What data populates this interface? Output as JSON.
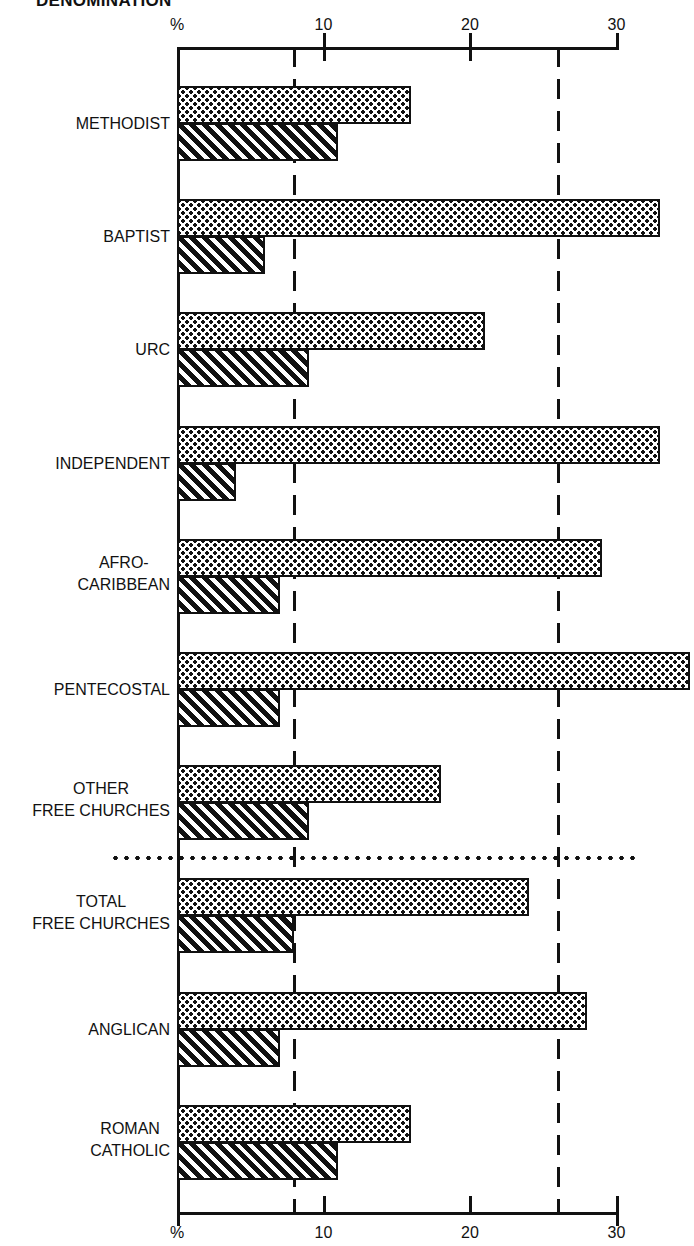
{
  "title": "DENOMINATION",
  "axis": {
    "unit_label": "%",
    "ticks": [
      {
        "value": 10,
        "label": "10"
      },
      {
        "value": 20,
        "label": "20"
      },
      {
        "value": 30,
        "label": "30"
      }
    ]
  },
  "reference_lines": [
    8,
    26
  ],
  "colors": {
    "ink": "#111111",
    "background": "#ffffff"
  },
  "chart_data": {
    "type": "bar",
    "orientation": "horizontal",
    "title": "DENOMINATION",
    "xlabel": "%",
    "ylabel": "",
    "xlim": [
      0,
      30
    ],
    "grid": false,
    "x_ticks": [
      0,
      10,
      20,
      30
    ],
    "axes": "top and bottom percentage scales",
    "categories": [
      "METHODIST",
      "BAPTIST",
      "URC",
      "INDEPENDENT",
      "AFRO-CARIBBEAN",
      "PENTECOSTAL",
      "OTHER FREE CHURCHES",
      "TOTAL FREE CHURCHES",
      "ANGLICAN",
      "ROMAN CATHOLIC"
    ],
    "series": [
      {
        "name": "Dotted bars (upper)",
        "pattern": "dotted",
        "values": [
          16,
          33,
          21,
          33,
          29,
          35,
          18,
          24,
          28,
          16
        ]
      },
      {
        "name": "Hatched bars (lower)",
        "pattern": "hatched",
        "values": [
          11,
          6,
          9,
          4,
          7,
          7,
          9,
          8,
          7,
          11
        ]
      }
    ],
    "reference_lines": [
      {
        "value": 8,
        "style": "dashed",
        "note": "aligned with total hatched average"
      },
      {
        "value": 26,
        "style": "dashed"
      }
    ],
    "annotations": [
      "Dotted separator line between OTHER FREE CHURCHES and TOTAL FREE CHURCHES"
    ],
    "legend": "none visible"
  },
  "rows": [
    {
      "label_lines": [
        "METHODIST"
      ],
      "dotted": 16,
      "hatched": 11
    },
    {
      "label_lines": [
        "BAPTIST"
      ],
      "dotted": 33,
      "hatched": 6
    },
    {
      "label_lines": [
        "URC"
      ],
      "dotted": 21,
      "hatched": 9
    },
    {
      "label_lines": [
        "INDEPENDENT"
      ],
      "dotted": 33,
      "hatched": 4
    },
    {
      "label_lines": [
        "AFRO-",
        "CARIBBEAN"
      ],
      "dotted": 29,
      "hatched": 7
    },
    {
      "label_lines": [
        "PENTECOSTAL"
      ],
      "dotted": 35,
      "hatched": 7
    },
    {
      "label_lines": [
        "OTHER",
        "FREE CHURCHES"
      ],
      "dotted": 18,
      "hatched": 9
    },
    {
      "label_lines": [
        "TOTAL",
        "FREE CHURCHES"
      ],
      "dotted": 24,
      "hatched": 8
    },
    {
      "label_lines": [
        "ANGLICAN"
      ],
      "dotted": 28,
      "hatched": 7
    },
    {
      "label_lines": [
        "ROMAN",
        "CATHOLIC"
      ],
      "dotted": 16,
      "hatched": 11
    }
  ]
}
